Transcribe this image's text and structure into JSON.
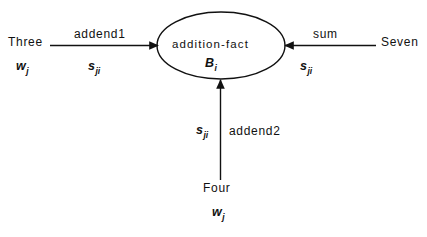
{
  "diagram": {
    "type": "semantic-network",
    "background_color": "#ffffff",
    "stroke_color": "#111111",
    "center_node": {
      "label": "addition-fact",
      "symbol": "B",
      "symbol_subscript": "i"
    },
    "nodes": [
      {
        "id": "three",
        "label": "Three",
        "symbol": "w",
        "symbol_subscript": "j",
        "position": "left"
      },
      {
        "id": "seven",
        "label": "Seven",
        "symbol": "w",
        "symbol_subscript": "j",
        "position": "right"
      },
      {
        "id": "four",
        "label": "Four",
        "symbol": "w",
        "symbol_subscript": "j",
        "position": "bottom"
      }
    ],
    "edges": [
      {
        "id": "addend1",
        "label": "addend1",
        "symbol": "s",
        "symbol_subscript": "ji",
        "from": "three",
        "to": "addition-fact",
        "direction": "right"
      },
      {
        "id": "sum",
        "label": "sum",
        "symbol": "s",
        "symbol_subscript": "ji",
        "from": "seven",
        "to": "addition-fact",
        "direction": "left"
      },
      {
        "id": "addend2",
        "label": "addend2",
        "symbol": "s",
        "symbol_subscript": "ji",
        "from": "four",
        "to": "addition-fact",
        "direction": "up"
      }
    ]
  }
}
